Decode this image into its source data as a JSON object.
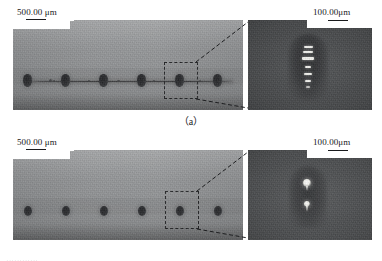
{
  "figure": {
    "panels": [
      {
        "id": "a",
        "caption": "（a）",
        "overview": {
          "scale_label": "500.00 μm",
          "spot_count": 6,
          "has_connecting_trace": true,
          "selection_index": 4
        },
        "inset": {
          "scale_label": "100.00μm",
          "feature": "bright-dash-stack",
          "bright_marks": 6
        }
      },
      {
        "id": "b",
        "caption": "（b）",
        "overview": {
          "scale_label": "500.00 μm",
          "spot_count": 6,
          "has_connecting_trace": false,
          "selection_index": 4
        },
        "inset": {
          "scale_label": "100.00μm",
          "feature": "two-bright-dots",
          "bright_marks": 2
        }
      }
    ],
    "page_sliver_text": "············"
  }
}
